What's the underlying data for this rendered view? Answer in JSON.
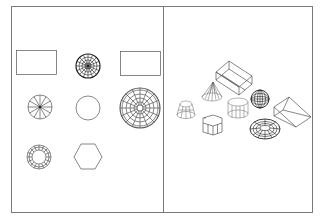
{
  "diagram": {
    "type": "cad-drawing",
    "panels": [
      {
        "id": "left",
        "view": "2D plan views",
        "shapes": [
          "rectangle",
          "sphere-plan",
          "rectangle",
          "cone-plan",
          "circle",
          "dome-plan",
          "torus-plan",
          "hexagon"
        ]
      },
      {
        "id": "right",
        "view": "3D wireframe isometric",
        "shapes": [
          "box",
          "cone",
          "frustum",
          "cylinder",
          "sphere",
          "wedge",
          "hexagonal-prism",
          "torus"
        ]
      }
    ],
    "colors": {
      "background": "#ffffff",
      "frame": "#7a7a7a",
      "lines": "#333333"
    }
  }
}
